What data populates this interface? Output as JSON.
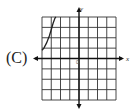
{
  "option_label": "(C)",
  "chart_data": {
    "type": "line",
    "title": "",
    "xlabel": "x",
    "ylabel": "y",
    "origin_label": "0",
    "xlim": [
      -4,
      4
    ],
    "ylim": [
      -4,
      4
    ],
    "grid": true,
    "series": [
      {
        "name": "curve",
        "x": [
          -4,
          -3.8,
          -3.5,
          -3.2,
          -3.0,
          -2.8,
          -2.6,
          -2.5
        ],
        "y": [
          0.8,
          1.0,
          1.5,
          2.2,
          2.8,
          3.4,
          3.9,
          4.0
        ]
      }
    ]
  }
}
